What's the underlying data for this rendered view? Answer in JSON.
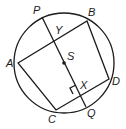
{
  "diagram": {
    "type": "geometry",
    "circle": {
      "center": "S",
      "cx": 64,
      "cy": 63,
      "r": 50
    },
    "points": {
      "P": {
        "x": 42,
        "y": 17,
        "label": "P",
        "lx": 33,
        "ly": 14
      },
      "B": {
        "x": 87,
        "y": 21,
        "label": "B",
        "lx": 88,
        "ly": 16
      },
      "A": {
        "x": 18,
        "y": 63,
        "label": "A",
        "lx": 6,
        "ly": 67
      },
      "D": {
        "x": 109,
        "y": 79,
        "label": "D",
        "lx": 112,
        "ly": 85
      },
      "C": {
        "x": 56,
        "y": 110,
        "label": "C",
        "lx": 48,
        "ly": 123
      },
      "Q": {
        "x": 86,
        "y": 107,
        "label": "Q",
        "lx": 87,
        "ly": 117
      },
      "S": {
        "x": 64,
        "y": 63,
        "label": "S",
        "lx": 67,
        "ly": 60
      },
      "Y": {
        "x": 52,
        "y": 42,
        "label": "Y",
        "lx": 55,
        "ly": 34
      },
      "X": {
        "x": 78,
        "y": 91,
        "label": "X",
        "lx": 80,
        "ly": 89
      }
    },
    "segments": [
      "AB",
      "BD",
      "DC",
      "CA",
      "PQ"
    ],
    "right_angle_at": "X",
    "colors": {
      "stroke": "#1a1a1a",
      "background": "#ffffff"
    }
  }
}
